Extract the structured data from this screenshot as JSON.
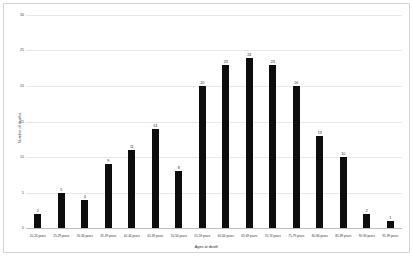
{
  "chart_data": {
    "type": "bar",
    "title": "",
    "xlabel": "Ages at death",
    "ylabel": "Number of deaths",
    "categories": [
      "20-24 years",
      "25-29 years",
      "30-34 years",
      "35-39 years",
      "40-44 years",
      "45-49 years",
      "50-54 years",
      "55-59 years",
      "60-64 years",
      "65-69 years",
      "70-74 years",
      "75-79 years",
      "80-84 years",
      "85-89 years",
      "90-94 years",
      "95-99 years"
    ],
    "values": [
      2,
      5,
      4,
      9,
      11,
      14,
      8,
      20,
      23,
      24,
      23,
      20,
      13,
      10,
      2,
      1
    ],
    "ylim": [
      0,
      30
    ],
    "yticks": [
      0,
      5,
      10,
      15,
      20,
      25,
      30
    ],
    "ytick_labels": [
      "0",
      "5",
      "10",
      "15",
      "20",
      "25",
      "30"
    ],
    "grid": true,
    "legend": "none",
    "bar_color": "#0d0d0d",
    "grid_color": "#e8e8e8",
    "axis_color": "#bfbfbf",
    "data_labels": [
      "2",
      "5",
      "4",
      "9",
      "11",
      "14",
      "8",
      "20",
      "23",
      "24",
      "23",
      "20",
      "13",
      "10",
      "2",
      "1"
    ]
  }
}
